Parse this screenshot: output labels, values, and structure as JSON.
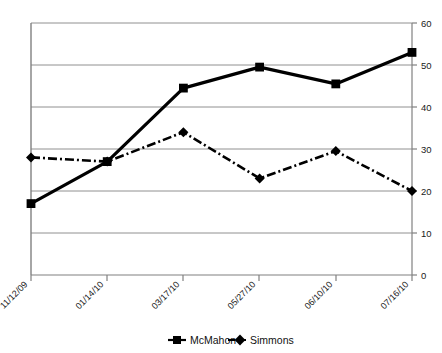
{
  "chart_data": {
    "type": "line",
    "title": "",
    "subtitle": "",
    "xlabel": "",
    "ylabel": "",
    "categories": [
      "11/12/09",
      "01/14/10",
      "03/17/10",
      "05/27/10",
      "06/10/10",
      "07/16/10"
    ],
    "series": [
      {
        "name": "McMahon",
        "marker": "square",
        "line_style": "solid",
        "color": "#000000",
        "values": [
          17,
          27,
          44.5,
          49.5,
          45.5,
          53
        ]
      },
      {
        "name": "Simmons",
        "marker": "diamond",
        "line_style": "dash-dot",
        "color": "#000000",
        "values": [
          28,
          27,
          34,
          23,
          29.5,
          20
        ]
      }
    ],
    "ylim": [
      0,
      60
    ],
    "y_ticks": [
      0,
      10,
      20,
      30,
      40,
      50,
      60
    ],
    "y_tick_labels": [
      "0",
      "10",
      "20",
      "30",
      "40",
      "50",
      "60"
    ],
    "y_axis_position": "right",
    "grid": true,
    "grid_axis": "y",
    "legend_position": "bottom",
    "x_tick_label_rotation": -45
  },
  "legend": {
    "entries": [
      {
        "label": "McMahon",
        "marker": "square-marker-icon"
      },
      {
        "label": "Simmons",
        "marker": "diamond-marker-icon"
      }
    ]
  },
  "axis": {
    "y_labels": [
      "60",
      "50",
      "40",
      "30",
      "20",
      "10",
      "0"
    ],
    "x_labels": [
      "11/12/09",
      "01/14/10",
      "03/17/10",
      "05/27/10",
      "06/10/10",
      "07/16/10"
    ]
  },
  "colors": {
    "series": "#000000",
    "gridline": "#808080",
    "axis": "#808080",
    "background": "#ffffff"
  }
}
